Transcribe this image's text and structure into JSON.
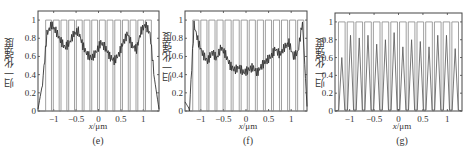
{
  "figure": {
    "ylabel": "归一化强度",
    "xlabel_var": "x",
    "xlabel_unit": "/μm"
  },
  "chart_data": [
    {
      "type": "line",
      "caption": "(e)",
      "title": "",
      "xlabel": "x/μm",
      "ylabel": "归一化强度",
      "xlim": [
        -1.35,
        1.35
      ],
      "ylim": [
        0,
        1.1
      ],
      "xticks": [
        -1,
        -0.5,
        0,
        0.5,
        1
      ],
      "xtick_labels": [
        "−1",
        "−0.5",
        "0",
        "0.5",
        "1"
      ],
      "yticks": [
        0,
        0.2,
        0.4,
        0.6,
        0.8,
        1
      ],
      "ytick_labels": [
        "0",
        "0.2",
        "0.4",
        "0.6",
        "0.8",
        "1"
      ],
      "grid": false,
      "series": [
        {
          "name": "grating (binary)",
          "kind": "square-wave",
          "bar_count": 14,
          "high": 1.0,
          "low": 0.0,
          "x_start": -1.2,
          "x_end": 1.2
        },
        {
          "name": "intensity",
          "x": [
            -1.35,
            -1.25,
            -1.15,
            -1.05,
            -0.95,
            -0.85,
            -0.75,
            -0.65,
            -0.55,
            -0.45,
            -0.35,
            -0.25,
            -0.15,
            -0.05,
            0.05,
            0.15,
            0.25,
            0.35,
            0.45,
            0.55,
            0.65,
            0.75,
            0.85,
            0.95,
            1.05,
            1.15,
            1.25,
            1.35
          ],
          "values": [
            0.02,
            0.3,
            0.85,
            0.95,
            0.88,
            0.78,
            0.7,
            0.75,
            0.85,
            0.88,
            0.72,
            0.62,
            0.58,
            0.65,
            0.75,
            0.7,
            0.6,
            0.55,
            0.62,
            0.75,
            0.85,
            0.72,
            0.68,
            0.88,
            0.95,
            0.85,
            0.35,
            0.02
          ]
        }
      ]
    },
    {
      "type": "line",
      "caption": "(f)",
      "title": "",
      "xlabel": "x/μm",
      "ylabel": "归一化强度",
      "xlim": [
        -1.35,
        1.35
      ],
      "ylim": [
        0,
        1.1
      ],
      "xticks": [
        -1,
        -0.5,
        0,
        0.5,
        1
      ],
      "xtick_labels": [
        "−1",
        "−0.5",
        "0",
        "0.5",
        "1"
      ],
      "yticks": [
        0,
        0.2,
        0.4,
        0.6,
        0.8,
        1
      ],
      "ytick_labels": [
        "0",
        "0.2",
        "0.4",
        "0.6",
        "0.8",
        "1"
      ],
      "grid": false,
      "series": [
        {
          "name": "grating (binary)",
          "kind": "square-wave",
          "bar_count": 14,
          "high": 1.0,
          "low": 0.0,
          "x_start": -1.2,
          "x_end": 1.3
        },
        {
          "name": "intensity",
          "x": [
            -1.35,
            -1.25,
            -1.15,
            -1.05,
            -0.95,
            -0.85,
            -0.75,
            -0.65,
            -0.55,
            -0.45,
            -0.35,
            -0.25,
            -0.15,
            -0.05,
            0.05,
            0.15,
            0.25,
            0.35,
            0.45,
            0.55,
            0.65,
            0.75,
            0.85,
            0.95,
            1.05,
            1.15,
            1.25,
            1.35
          ],
          "values": [
            0.1,
            0.02,
            0.95,
            0.75,
            0.62,
            0.55,
            0.65,
            0.58,
            0.7,
            0.62,
            0.5,
            0.45,
            0.48,
            0.42,
            0.45,
            0.48,
            0.42,
            0.5,
            0.55,
            0.6,
            0.68,
            0.62,
            0.7,
            0.75,
            0.6,
            0.65,
            0.98,
            0.05
          ]
        }
      ]
    },
    {
      "type": "line",
      "caption": "(g)",
      "title": "",
      "xlabel": "x/μm",
      "ylabel": "归一化强度",
      "xlim": [
        -1.3,
        1.3
      ],
      "ylim": [
        0,
        1.1
      ],
      "xticks": [
        -1,
        -0.5,
        0,
        0.5,
        1
      ],
      "xtick_labels": [
        "−1",
        "−0.5",
        "0",
        "0.5",
        "1"
      ],
      "yticks": [
        0,
        0.2,
        0.4,
        0.6,
        0.8,
        1
      ],
      "ytick_labels": [
        "0",
        "0.2",
        "0.4",
        "0.6",
        "0.8",
        "1"
      ],
      "grid": false,
      "series": [
        {
          "name": "grating (binary)",
          "kind": "square-wave",
          "bar_count": 14,
          "high": 1.0,
          "low": 0.0,
          "x_start": -1.25,
          "x_end": 1.25
        },
        {
          "name": "intensity peaks",
          "kind": "peaks",
          "peak_values": [
            0.6,
            0.85,
            0.82,
            0.85,
            0.75,
            0.8,
            0.88,
            0.72,
            0.8,
            0.78,
            0.72,
            0.85,
            0.85,
            0.7
          ]
        }
      ]
    }
  ]
}
